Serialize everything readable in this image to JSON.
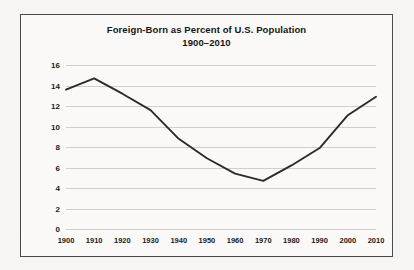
{
  "chart_data": {
    "type": "line",
    "title": "Foreign-Born as Percent of U.S. Population",
    "subtitle": "1900–2010",
    "xlabel": "",
    "ylabel": "",
    "categories": [
      1900,
      1910,
      1920,
      1930,
      1940,
      1950,
      1960,
      1970,
      1980,
      1990,
      2000,
      2010
    ],
    "x_tick_labels": [
      "1900",
      "1910",
      "1920",
      "1930",
      "1940",
      "1950",
      "1960",
      "1970",
      "1980",
      "1990",
      "2000",
      "2010"
    ],
    "values": [
      13.6,
      14.7,
      13.2,
      11.6,
      8.8,
      6.9,
      5.4,
      4.7,
      6.2,
      7.9,
      11.1,
      12.9
    ],
    "y_tick_labels": [
      "0",
      "2",
      "4",
      "6",
      "8",
      "10",
      "12",
      "14",
      "16"
    ],
    "y_ticks": [
      0,
      2,
      4,
      6,
      8,
      10,
      12,
      14,
      16
    ],
    "xlim": [
      1900,
      2010
    ],
    "ylim": [
      0,
      16
    ],
    "grid": "horizontal",
    "legend": "none",
    "series_color": "#2b2b2b",
    "gridline_color": "#cfcfcf",
    "frame_color": "#4a4a4a",
    "background_color": "#faf9f7",
    "page_color": "#f6f5f3"
  }
}
